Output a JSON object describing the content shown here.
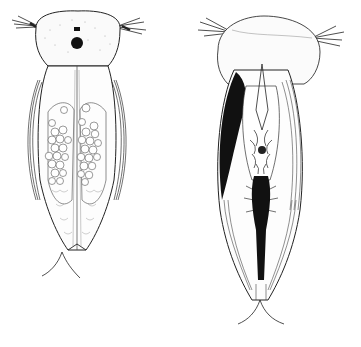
{
  "figure": {
    "background": "#ffffff",
    "ink_color": "#1a1a1a",
    "specimens": [
      {
        "id": "left",
        "view": "dorsal",
        "description": "crustacean with egg clusters in brood pouch, single dark eye",
        "egg_count_visible": 40
      },
      {
        "id": "right",
        "view": "ventral",
        "description": "crustacean showing appendages and dark shaded carapace margins"
      }
    ]
  }
}
